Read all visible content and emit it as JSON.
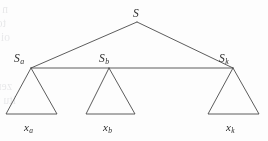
{
  "figure": {
    "type": "parse-tree-diagram",
    "background_color": "#fdfdfd",
    "stroke_color": "#4a4a4a",
    "label_color": "#2b2b2b",
    "width": 268,
    "height": 141,
    "root": {
      "name": "S",
      "base": "S",
      "subscript": "",
      "x": 137,
      "y": 22,
      "label_x": 133,
      "label_y": 8
    },
    "children": [
      {
        "name": "S_a",
        "base": "S",
        "subscript": "a",
        "apex_x": 31,
        "apex_y": 68,
        "label_x": 14,
        "label_y": 53,
        "triangle_left_x": 6,
        "triangle_right_x": 57,
        "baseline_y": 114,
        "leaf": {
          "name": "x_a",
          "base": "x",
          "subscript": "a",
          "label_x": 24,
          "label_y": 122
        }
      },
      {
        "name": "S_b",
        "base": "S",
        "subscript": "b",
        "apex_x": 109,
        "apex_y": 68,
        "label_x": 99,
        "label_y": 53,
        "triangle_left_x": 86,
        "triangle_right_x": 135,
        "baseline_y": 114,
        "leaf": {
          "name": "x_b",
          "base": "x",
          "subscript": "b",
          "label_x": 103,
          "label_y": 122
        }
      },
      {
        "name": "S_k",
        "base": "S",
        "subscript": "k",
        "apex_x": 233,
        "apex_y": 68,
        "label_x": 219,
        "label_y": 53,
        "triangle_left_x": 208,
        "triangle_right_x": 259,
        "baseline_y": 114,
        "leaf": {
          "name": "x_k",
          "base": "x",
          "subscript": "k",
          "label_x": 226,
          "label_y": 122
        }
      }
    ],
    "connector": {
      "name": "sibling-connector-line",
      "x1": 31,
      "y1": 68,
      "x2": 233,
      "y2": 68
    },
    "background_bleed_text": [
      {
        "text": "n wen zinemugns zin ezusced ,ewonz ai ti",
        "x": 8,
        "y": 3
      },
      {
        "text": "ton tnellsoxe nsez ton bluow ti gnirubotta",
        "x": 6,
        "y": 17
      },
      {
        "text": "oi ,emsrtxe tahtiw ai ti ,zi ti A tahT",
        "x": 10,
        "y": 31
      },
      {
        "text": "zeneg e-eviz rot gnitaluminb rot gnimoz",
        "x": 12,
        "y": 80
      },
      {
        "text": "itu tA, emoz te zeviz oi ztgeb zi wen",
        "x": 16,
        "y": 94
      }
    ]
  }
}
